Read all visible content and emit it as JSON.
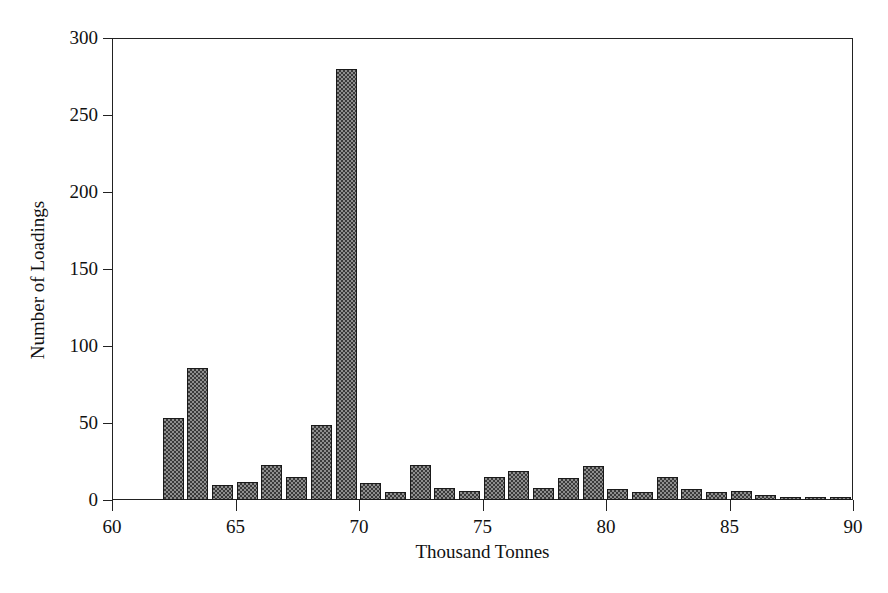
{
  "chart_data": {
    "type": "bar",
    "title": "",
    "subtitle": "",
    "xlabel": "Thousand Tonnes",
    "ylabel": "Number of Loadings",
    "xlim": [
      60,
      90
    ],
    "ylim": [
      0,
      300
    ],
    "xticks": [
      60,
      65,
      70,
      75,
      80,
      85,
      90
    ],
    "xticklabels": [
      "60",
      "65",
      "70",
      "75",
      "80",
      "85",
      "90"
    ],
    "yticks": [
      0,
      50,
      100,
      150,
      200,
      250,
      300
    ],
    "yticklabels": [
      "0",
      "50",
      "100",
      "150",
      "200",
      "250",
      "300"
    ],
    "grid": false,
    "legend": false,
    "bin_width": 1,
    "bar_style": {
      "fill": "checkerboard-hatch",
      "fill_color": "#8e8e8e",
      "hatch_color": "#3a3a3a",
      "edge_color": "#1a1a1a"
    },
    "categories": [
      "62",
      "63",
      "64",
      "65",
      "66",
      "67",
      "68",
      "69",
      "70",
      "71",
      "72",
      "73",
      "74",
      "75",
      "76",
      "77",
      "78",
      "79",
      "80",
      "81",
      "82",
      "83",
      "84",
      "85",
      "86",
      "87",
      "88",
      "89"
    ],
    "bin_starts": [
      62,
      63,
      64,
      65,
      66,
      67,
      68,
      69,
      70,
      71,
      72,
      73,
      74,
      75,
      76,
      77,
      78,
      79,
      80,
      81,
      82,
      83,
      84,
      85,
      86,
      87,
      88,
      89
    ],
    "values": [
      53,
      86,
      10,
      12,
      23,
      15,
      49,
      280,
      11,
      5,
      23,
      8,
      6,
      15,
      19,
      8,
      14,
      22,
      7,
      5,
      15,
      7,
      5,
      6,
      3,
      2,
      2,
      2
    ]
  },
  "axes": {
    "y_title": "Number of Loadings",
    "x_title": "Thousand Tonnes"
  }
}
